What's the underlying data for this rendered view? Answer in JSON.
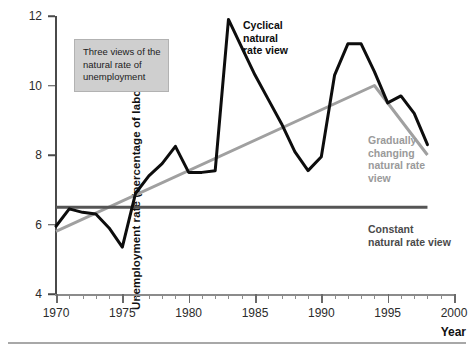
{
  "figure": {
    "y_axis_title": "Unemployment rate (percentage of labour force)",
    "x_axis_title": "Year"
  },
  "legend_box": {
    "line1": "Three views of the",
    "line2": "natural rate of",
    "line3": "unemployment"
  },
  "annotations": {
    "cyclical": "Cyclical\nnatural\nrate view",
    "cyclical_l1": "Cyclical",
    "cyclical_l2": "natural",
    "cyclical_l3": "rate view",
    "gradual_l1": "Gradually",
    "gradual_l2": "changing",
    "gradual_l3": "natural rate",
    "gradual_l4": "view",
    "constant_l1": "Constant",
    "constant_l2": "natural rate view"
  },
  "colors": {
    "data_line": "#0d0d0d",
    "gradual_line": "#a0a0a0",
    "constant_line": "#555555",
    "axis": "#4a4a4a",
    "legend_bg": "#cfcfcf",
    "bottom_rule": "#a8a8a8"
  },
  "y_ticks": [
    "4",
    "6",
    "8",
    "10",
    "12"
  ],
  "y_tick_values": [
    4,
    6,
    8,
    10,
    12
  ],
  "x_ticks": [
    "1970",
    "1975",
    "1980",
    "1985",
    "1990",
    "1995",
    "2000"
  ],
  "x_tick_values": [
    1970,
    1975,
    1980,
    1985,
    1990,
    1995,
    2000
  ],
  "chart_data": {
    "type": "line",
    "title": "Three views of the natural rate of unemployment",
    "xlabel": "Year",
    "ylabel": "Unemployment rate (percentage of labour force)",
    "xlim": [
      1970,
      2000
    ],
    "ylim": [
      4,
      12
    ],
    "grid": false,
    "legend_position": "inline-annotations",
    "x": [
      1970,
      1971,
      1972,
      1973,
      1974,
      1975,
      1976,
      1977,
      1978,
      1979,
      1980,
      1981,
      1982,
      1983,
      1984,
      1985,
      1986,
      1987,
      1988,
      1989,
      1990,
      1991,
      1992,
      1993,
      1994,
      1995,
      1996,
      1997,
      1998
    ],
    "series": [
      {
        "name": "Unemployment rate (actual)",
        "color": "#0d0d0d",
        "style": "solid",
        "width": 3,
        "values": [
          5.95,
          6.45,
          6.35,
          6.3,
          5.9,
          5.35,
          6.9,
          7.4,
          7.75,
          8.25,
          7.5,
          7.5,
          7.55,
          11.9,
          11.1,
          10.3,
          9.6,
          8.9,
          8.1,
          7.55,
          7.95,
          10.3,
          11.2,
          11.2,
          10.4,
          9.5,
          9.7,
          9.2,
          8.3
        ]
      },
      {
        "name": "Gradually changing natural rate view",
        "color": "#a0a0a0",
        "style": "solid",
        "width": 3,
        "x": [
          1970,
          1994,
          1998
        ],
        "values": [
          5.8,
          10.0,
          8.0
        ]
      },
      {
        "name": "Constant natural rate view",
        "color": "#555555",
        "style": "solid",
        "width": 3,
        "x": [
          1970,
          1998
        ],
        "values": [
          6.5,
          6.5
        ]
      }
    ],
    "annotations": [
      {
        "text": "Cyclical natural rate view",
        "x": 1984.5,
        "y": 11.6
      },
      {
        "text": "Gradually changing natural rate view",
        "x": 1994.5,
        "y": 8.3
      },
      {
        "text": "Constant natural rate view",
        "x": 1994.5,
        "y": 5.9
      },
      {
        "text": "Three views of the natural rate of unemployment",
        "x": 1972,
        "y": 11.0
      }
    ]
  }
}
